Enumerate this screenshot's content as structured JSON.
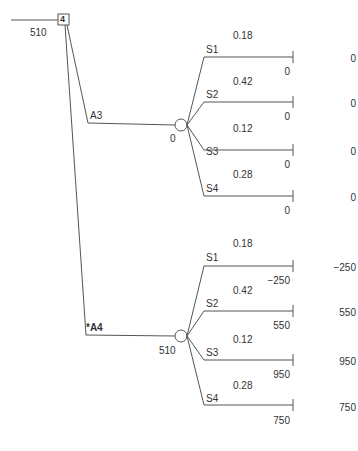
{
  "root": {
    "id": "4",
    "value": "510"
  },
  "colors": {
    "line": "#555555",
    "text": "#333333"
  },
  "alternatives": [
    {
      "label": "A3",
      "optimal": false,
      "ev": "0",
      "branches": [
        {
          "state": "S1",
          "prob": "0.18",
          "payoff": "0",
          "result": "0"
        },
        {
          "state": "S2",
          "prob": "0.42",
          "payoff": "0",
          "result": "0"
        },
        {
          "state": "S3",
          "prob": "0.12",
          "payoff": "0",
          "result": "0"
        },
        {
          "state": "S4",
          "prob": "0.28",
          "payoff": "0",
          "result": "0"
        }
      ]
    },
    {
      "label": "*A4",
      "optimal": true,
      "ev": "510",
      "branches": [
        {
          "state": "S1",
          "prob": "0.18",
          "payoff": "−250",
          "result": "−250"
        },
        {
          "state": "S2",
          "prob": "0.42",
          "payoff": "550",
          "result": "550"
        },
        {
          "state": "S3",
          "prob": "0.12",
          "payoff": "950",
          "result": "950"
        },
        {
          "state": "S4",
          "prob": "0.28",
          "payoff": "750",
          "result": "750"
        }
      ]
    }
  ]
}
